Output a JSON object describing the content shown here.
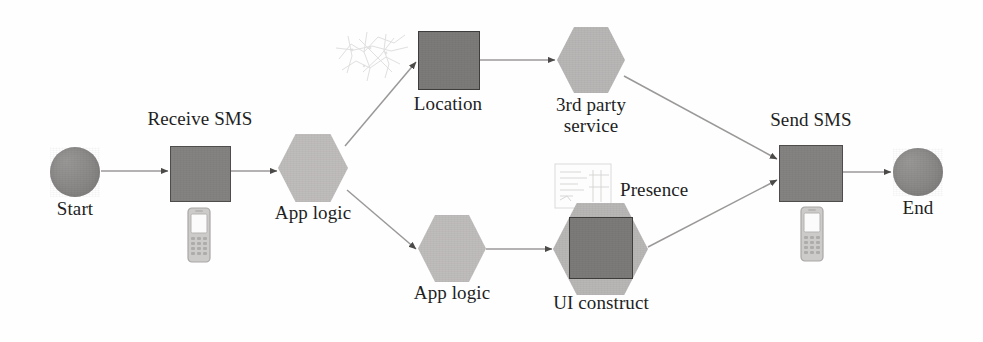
{
  "diagram": {
    "background_color": "#fefefe",
    "palette": {
      "circle_fill": "#8e8c8b",
      "box_fill": "#858382",
      "box_dark_fill": "#7d7b7a",
      "box_stroke": "#4f4d4c",
      "hex_fill": "#b9b7b6",
      "hex_light_fill": "#bfbdbc",
      "edge_stroke": "#9b9998",
      "text_color": "#231f1e"
    },
    "nodes": [
      {
        "id": "start",
        "label": "Start",
        "shape": "circle",
        "label_position": "below"
      },
      {
        "id": "receive_sms",
        "label": "Receive SMS",
        "shape": "rectangle",
        "label_position": "above"
      },
      {
        "id": "app_logic_1",
        "label": "App logic",
        "shape": "hexagon",
        "label_position": "below"
      },
      {
        "id": "location",
        "label": "Location",
        "shape": "rectangle",
        "label_position": "below"
      },
      {
        "id": "third_party",
        "label": "3rd party\nservice",
        "shape": "hexagon",
        "label_position": "below"
      },
      {
        "id": "app_logic_2",
        "label": "App logic",
        "shape": "hexagon",
        "label_position": "below"
      },
      {
        "id": "ui_construct",
        "label": "UI construct",
        "shape": "hexagon-with-square",
        "label_position": "below"
      },
      {
        "id": "presence",
        "label": "Presence",
        "shape": "annotation",
        "label_position": "inline"
      },
      {
        "id": "send_sms",
        "label": "Send SMS",
        "shape": "rectangle",
        "label_position": "above"
      },
      {
        "id": "end",
        "label": "End",
        "shape": "circle",
        "label_position": "below"
      }
    ],
    "edges": [
      {
        "from": "start",
        "to": "receive_sms"
      },
      {
        "from": "receive_sms",
        "to": "app_logic_1"
      },
      {
        "from": "app_logic_1",
        "to": "location"
      },
      {
        "from": "app_logic_1",
        "to": "app_logic_2"
      },
      {
        "from": "location",
        "to": "third_party"
      },
      {
        "from": "third_party",
        "to": "send_sms"
      },
      {
        "from": "app_logic_2",
        "to": "ui_construct"
      },
      {
        "from": "ui_construct",
        "to": "send_sms"
      },
      {
        "from": "send_sms",
        "to": "end"
      }
    ],
    "icons": [
      {
        "id": "map-icon",
        "near": "location",
        "description": "faint map / route sketch"
      },
      {
        "id": "document-icon",
        "near": "presence",
        "description": "faint document with lines"
      },
      {
        "id": "phone-icon-1",
        "near": "receive_sms",
        "description": "mobile phone handset"
      },
      {
        "id": "phone-icon-2",
        "near": "send_sms",
        "description": "mobile phone handset"
      }
    ]
  }
}
